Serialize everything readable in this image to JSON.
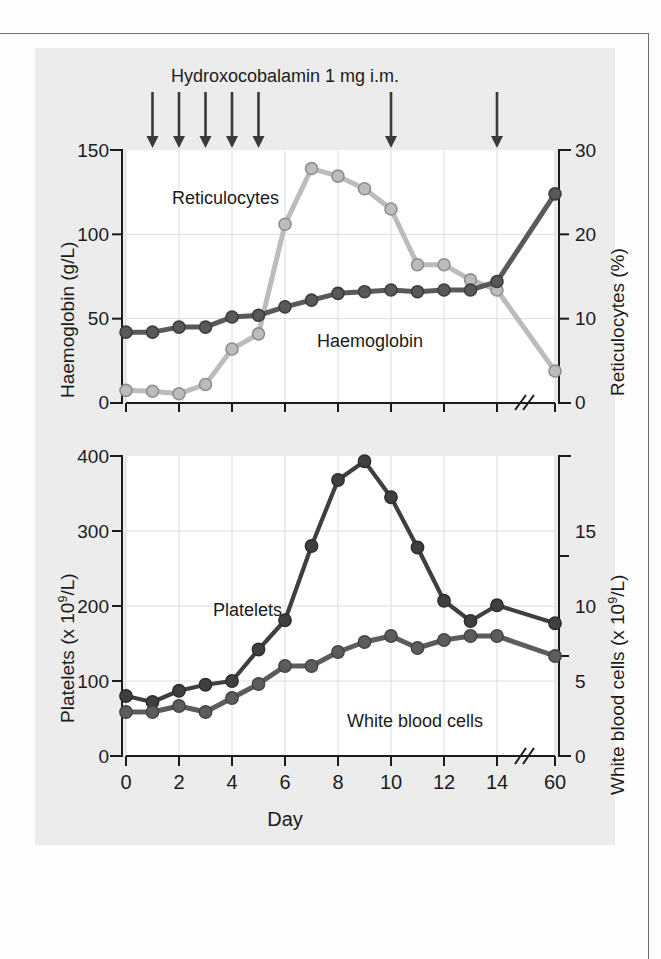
{
  "page": {
    "background": "#fdfdfd",
    "panel_background": "#ececec",
    "plot_background": "#ffffff",
    "rule_color": "#6e6e6e"
  },
  "colors": {
    "haemoglobin": "#595959",
    "reticulocytes": "#bcbcbc",
    "platelets": "#3f3f3f",
    "white_blood_cells": "#5c5c5c",
    "grid": "#dcdcdc",
    "axis": "#1b1b1b",
    "marker_edge": "#4a4a4a"
  },
  "annotation": {
    "dose_title": "Hydroxocobalamin 1 mg i.m.",
    "arrow_icon": "down-arrow",
    "arrow_days": [
      1,
      2,
      3,
      4,
      5,
      10,
      14
    ]
  },
  "x_axis": {
    "label": "Day",
    "tick_labels": [
      "0",
      "2",
      "4",
      "6",
      "8",
      "10",
      "12",
      "14",
      "60"
    ],
    "tick_days": [
      0,
      2,
      4,
      6,
      8,
      10,
      12,
      14,
      60
    ],
    "break_marker": "//",
    "break_after_day": 14,
    "range": [
      0,
      60
    ]
  },
  "chart_data": [
    {
      "type": "line",
      "title": "Hydroxocobalamin 1 mg i.m.",
      "xlabel": "Day",
      "ylabel": "Haemoglobin (g/L)",
      "y2label": "Reticulocytes (%)",
      "ylim": [
        0,
        150
      ],
      "y2lim": [
        0,
        30
      ],
      "yticks": [
        "0",
        "50",
        "100",
        "150"
      ],
      "y2ticks": [
        "0",
        "10",
        "20",
        "30"
      ],
      "grid": true,
      "legend_position": "inline-annotation",
      "x": [
        0,
        1,
        2,
        3,
        4,
        5,
        6,
        7,
        8,
        9,
        10,
        11,
        12,
        13,
        14,
        60
      ],
      "series": [
        {
          "name": "Haemoglobin",
          "axis": "left",
          "unit": "g/L",
          "color": "#595959",
          "values": [
            42,
            42,
            45,
            45,
            51,
            52,
            57,
            61,
            65,
            66,
            67,
            66,
            67,
            67,
            72,
            124
          ]
        },
        {
          "name": "Reticulocytes",
          "axis": "right",
          "unit": "%",
          "color": "#bcbcbc",
          "values": [
            1.5,
            1.4,
            1.1,
            2.2,
            6.4,
            8.2,
            21.2,
            27.8,
            26.9,
            25.4,
            23.0,
            16.4,
            16.4,
            14.6,
            13.4,
            3.8
          ]
        }
      ]
    },
    {
      "type": "line",
      "title": "",
      "xlabel": "Day",
      "ylabel": "Platelets (x 10⁹/L)",
      "y2label": "White blood cells (x 10⁹/L)",
      "ylim": [
        0,
        400
      ],
      "y2lim": [
        0,
        15
      ],
      "yticks": [
        "0",
        "100",
        "200",
        "300",
        "400"
      ],
      "y2ticks": [
        "0",
        "5",
        "10",
        "15"
      ],
      "grid": true,
      "legend_position": "inline-annotation",
      "x": [
        0,
        1,
        2,
        3,
        4,
        5,
        6,
        7,
        8,
        9,
        10,
        11,
        12,
        13,
        14,
        60
      ],
      "series": [
        {
          "name": "Platelets",
          "axis": "left",
          "unit": "x 10^9/L",
          "color": "#3f3f3f",
          "values": [
            80,
            72,
            87,
            95,
            100,
            142,
            181,
            280,
            368,
            393,
            345,
            278,
            207,
            180,
            201,
            177
          ]
        },
        {
          "name": "White blood cells",
          "axis": "right",
          "unit": "x 10^9/L",
          "color": "#5c5c5c",
          "values": [
            2.2,
            2.2,
            2.5,
            2.2,
            2.9,
            3.6,
            4.5,
            4.5,
            5.2,
            5.7,
            6.0,
            5.4,
            5.8,
            6.0,
            6.0,
            5.0
          ]
        }
      ]
    }
  ],
  "top_chart": {
    "y_left": {
      "title": "Haemoglobin (g/L)",
      "ticks": [
        "0",
        "50",
        "100",
        "150"
      ]
    },
    "y_right": {
      "title_prefix": "Reticulocytes (%)",
      "ticks": [
        "0",
        "10",
        "20",
        "30"
      ]
    },
    "labels": {
      "reticulocytes": "Reticulocytes",
      "haemoglobin": "Haemoglobin"
    }
  },
  "bottom_chart": {
    "y_left": {
      "title_pre": "Platelets (x 10",
      "title_sup": "9",
      "title_post": "/L)",
      "ticks": [
        "0",
        "100",
        "200",
        "300",
        "400"
      ]
    },
    "y_right": {
      "title_pre": "White blood cells (x 10",
      "title_sup": "9",
      "title_post": "/L)",
      "ticks": [
        "0",
        "5",
        "10",
        "15"
      ]
    },
    "labels": {
      "platelets": "Platelets",
      "white_blood_cells": "White blood cells"
    }
  }
}
